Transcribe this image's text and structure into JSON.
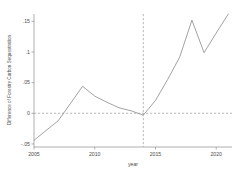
{
  "chart_data": {
    "type": "line",
    "title": "",
    "xlabel": "year",
    "ylabel": "Difference of Forestry Carbon Sequestration",
    "xlim": [
      2005,
      2021.3
    ],
    "ylim": [
      -0.055,
      0.162
    ],
    "xticks": [
      2005,
      2010,
      2015,
      2020
    ],
    "xtick_labels": [
      "2005",
      "2010",
      "2015",
      "2020"
    ],
    "yticks": [
      -0.05,
      0,
      0.05,
      0.1,
      0.15
    ],
    "ytick_labels": [
      "-.05",
      "0",
      ".05",
      ".1",
      ".15"
    ],
    "grid": false,
    "legend": "none",
    "series": [
      {
        "name": "Difference of Forestry Carbon Sequestration",
        "color": "#8a8a8a",
        "x": [
          2005,
          2006,
          2007,
          2008,
          2009,
          2010,
          2011,
          2012,
          2013,
          2014,
          2015,
          2016,
          2017,
          2018,
          2019,
          2020,
          2021
        ],
        "values": [
          -0.044,
          -0.028,
          -0.012,
          0.016,
          0.044,
          0.028,
          0.018,
          0.009,
          0.004,
          -0.003,
          0.021,
          0.055,
          0.092,
          0.152,
          0.099,
          0.131,
          0.162
        ]
      }
    ],
    "annotations": [
      {
        "name": "zero-reference-line",
        "type": "hline",
        "y": 0,
        "style": "dashed",
        "color": "#9a9a9a"
      },
      {
        "name": "policy-reference-line",
        "type": "vline",
        "x": 2014,
        "style": "dashed",
        "color": "#9a9a9a"
      }
    ]
  }
}
